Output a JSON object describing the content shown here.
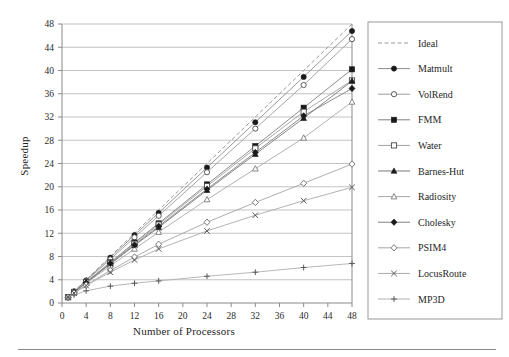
{
  "figure": {
    "background": "#ffffff",
    "axis_color": "#8a8a8a",
    "grid_color": "#b4b4b4",
    "text_color": "#2b2b2b",
    "legend_border_color": "#9a9a9a"
  },
  "axes": {
    "ylabel": "Speedup",
    "xlabel": "Number of Processors"
  },
  "chart_data": {
    "type": "line",
    "title": "",
    "xlabel": "Number of Processors",
    "ylabel": "Speedup",
    "xlim": [
      0,
      48
    ],
    "ylim": [
      0,
      48
    ],
    "xticks": [
      0,
      4,
      8,
      12,
      16,
      20,
      24,
      28,
      32,
      36,
      40,
      44,
      48
    ],
    "yticks": [
      0,
      4,
      8,
      12,
      16,
      20,
      24,
      28,
      32,
      36,
      40,
      44,
      48
    ],
    "grid": "horizontal",
    "legend_position": "right",
    "x": [
      1,
      2,
      4,
      8,
      12,
      16,
      24,
      32,
      40,
      48
    ],
    "series": [
      {
        "name": "Ideal",
        "marker": "none",
        "linestyle": "dashed",
        "color": "#9a9a9a",
        "values": [
          1,
          2,
          4,
          8,
          12,
          16,
          24,
          32,
          40,
          48
        ]
      },
      {
        "name": "Matmult",
        "marker": "filled-circle",
        "linestyle": "solid",
        "color": "#8d8d8d",
        "values": [
          1,
          2,
          3.9,
          7.8,
          11.7,
          15.5,
          23.3,
          31.1,
          38.9,
          46.8
        ]
      },
      {
        "name": "VolRend",
        "marker": "open-circle",
        "linestyle": "solid",
        "color": "#9c9c9c",
        "values": [
          1,
          1.95,
          3.8,
          7.5,
          11.3,
          15.0,
          22.5,
          30.0,
          37.5,
          45.4
        ]
      },
      {
        "name": "FMM",
        "marker": "filled-square",
        "linestyle": "solid",
        "color": "#808080",
        "values": [
          1,
          1.9,
          3.6,
          7.0,
          10.4,
          13.7,
          20.4,
          27.0,
          33.6,
          40.2
        ]
      },
      {
        "name": "Water",
        "marker": "open-square",
        "linestyle": "solid",
        "color": "#a0a0a0",
        "values": [
          1,
          1.9,
          3.6,
          6.9,
          10.2,
          13.5,
          20.1,
          26.6,
          32.9,
          38.3
        ]
      },
      {
        "name": "Barnes-Hut",
        "marker": "filled-triangle",
        "linestyle": "solid",
        "color": "#7a7a7a",
        "values": [
          1,
          1.85,
          3.5,
          6.7,
          9.9,
          13.0,
          19.4,
          25.6,
          31.8,
          38.2
        ]
      },
      {
        "name": "Radiosity",
        "marker": "open-triangle",
        "linestyle": "solid",
        "color": "#a8a8a8",
        "values": [
          1,
          1.8,
          3.4,
          6.4,
          9.3,
          12.2,
          17.8,
          23.1,
          28.4,
          34.6
        ]
      },
      {
        "name": "Cholesky",
        "marker": "filled-diamond",
        "linestyle": "solid",
        "color": "#828282",
        "values": [
          1,
          1.85,
          3.5,
          6.8,
          10.0,
          13.2,
          19.6,
          25.9,
          32.2,
          36.9
        ]
      },
      {
        "name": "PSIM4",
        "marker": "open-diamond",
        "linestyle": "solid",
        "color": "#a5a5a5",
        "values": [
          1,
          1.7,
          3.1,
          5.6,
          7.9,
          10.1,
          13.9,
          17.3,
          20.6,
          23.9
        ]
      },
      {
        "name": "LocusRoute",
        "marker": "cross-x",
        "linestyle": "solid",
        "color": "#aaaaaa",
        "values": [
          1,
          1.7,
          3.0,
          5.3,
          7.4,
          9.3,
          12.4,
          15.1,
          17.6,
          19.9
        ]
      },
      {
        "name": "MP3D",
        "marker": "plus",
        "linestyle": "solid",
        "color": "#b0b0b0",
        "values": [
          1,
          1.4,
          2.1,
          2.9,
          3.4,
          3.8,
          4.6,
          5.3,
          6.1,
          6.8
        ]
      }
    ]
  }
}
